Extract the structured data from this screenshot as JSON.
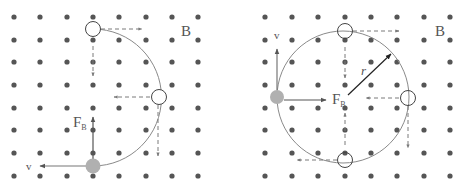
{
  "figure": {
    "colors": {
      "dot": "#555555",
      "path": "#8a8a8a",
      "arrow": "#555555",
      "dashed": "#7a7a7a",
      "particle_fill": "#b0b0b0",
      "label": "#555555"
    },
    "grid": {
      "rows_y": [
        17,
        40,
        62,
        85,
        108,
        130,
        153,
        176
      ]
    },
    "left_panel": {
      "grid_cols_x": [
        14,
        40,
        67,
        93,
        119,
        146,
        172,
        198
      ],
      "field_label": "B",
      "velocity_label": "v",
      "force_label": "F",
      "force_subscript": "B",
      "path": "semicircle",
      "positions": [
        {
          "name": "start",
          "x": 93,
          "y": 166,
          "filled": true
        },
        {
          "name": "top",
          "x": 93,
          "y": 29,
          "filled": false
        },
        {
          "name": "right",
          "x": 159,
          "y": 97,
          "filled": false
        }
      ]
    },
    "right_panel": {
      "grid_cols_x": [
        265,
        292,
        318,
        345,
        371,
        397,
        424,
        450
      ],
      "field_label": "B",
      "velocity_label": "v",
      "force_label": "F",
      "force_subscript": "B",
      "radius_label": "r",
      "path": "full-circle",
      "positions": [
        {
          "name": "left",
          "x": 277,
          "y": 97,
          "filled": true
        },
        {
          "name": "top",
          "x": 345,
          "y": 31,
          "filled": false
        },
        {
          "name": "right",
          "x": 408,
          "y": 98,
          "filled": false
        },
        {
          "name": "bottom",
          "x": 345,
          "y": 160,
          "filled": false
        }
      ]
    }
  }
}
